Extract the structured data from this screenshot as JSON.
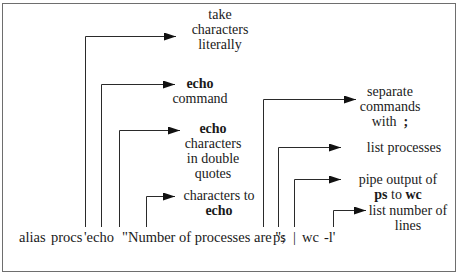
{
  "diagram": {
    "title": "",
    "command": {
      "tokens": [
        {
          "text": "alias",
          "x": 19
        },
        {
          "text": "procs",
          "x": 52
        },
        {
          "text": "'echo",
          "x": 85
        },
        {
          "text": "\"Number of processes are \";",
          "x": 122
        },
        {
          "text": "ps",
          "x": 273
        },
        {
          "text": "|",
          "x": 293
        },
        {
          "text": "wc",
          "x": 302
        },
        {
          "text": "-l'",
          "x": 325
        }
      ]
    },
    "annotations": [
      {
        "id": "take-characters-literally",
        "lines": [
          "take",
          "characters",
          "literally"
        ],
        "bold_line": null,
        "points_to": "'"
      },
      {
        "id": "echo-command",
        "lines": [
          "echo",
          "command"
        ],
        "bold_line": 0,
        "points_to": "echo"
      },
      {
        "id": "echo-characters-double-quotes",
        "lines": [
          "echo",
          "characters",
          "in double",
          "quotes"
        ],
        "bold_line": 0,
        "points_to": "\""
      },
      {
        "id": "characters-to-echo",
        "lines": [
          "characters to",
          "echo"
        ],
        "bold_line": 1,
        "points_to": "Number of processes are "
      },
      {
        "id": "separate-commands",
        "lines": [
          "separate",
          "commands",
          "with ;"
        ],
        "points_to": ";"
      },
      {
        "id": "list-processes",
        "lines": [
          "list processes"
        ],
        "points_to": "ps"
      },
      {
        "id": "pipe-output",
        "lines": [
          "pipe output of",
          "ps to wc"
        ],
        "points_to": "|"
      },
      {
        "id": "list-number-of-lines",
        "lines": [
          "list number of",
          "lines"
        ],
        "points_to": "-l"
      }
    ],
    "text": {
      "a1": [
        "take",
        "characters",
        "literally"
      ],
      "a2_bold": "echo",
      "a2": "command",
      "a3_bold": "echo",
      "a3": [
        "characters",
        "in double",
        "quotes"
      ],
      "a4": "characters to",
      "a4_bold": "echo",
      "a5": [
        "separate",
        "commands"
      ],
      "a5_with": "with",
      "a5_bold": ";",
      "a6": "list processes",
      "a7": "pipe output of",
      "a7_ps": "ps",
      "a7_to": " to ",
      "a7_wc": "wc",
      "a8": [
        "list number of",
        "lines"
      ]
    },
    "colors": {
      "line": "#2a2a2a",
      "frame": "#6e6e6e",
      "text": "#1a1a1a"
    }
  }
}
